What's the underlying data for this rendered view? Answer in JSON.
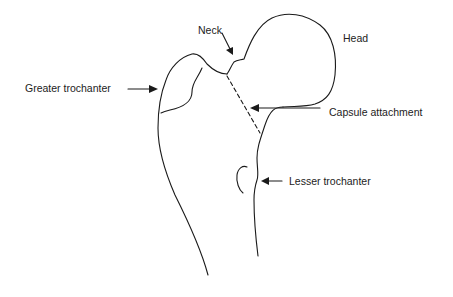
{
  "diagram": {
    "labels": {
      "neck": "Neck",
      "head": "Head",
      "greater_trochanter": "Greater trochanter",
      "capsule_attachment": "Capsule attachment",
      "lesser_trochanter": "Lesser trochanter"
    },
    "colors": {
      "line": "#1a1a1a",
      "text": "#222222",
      "background": "#ffffff"
    }
  }
}
